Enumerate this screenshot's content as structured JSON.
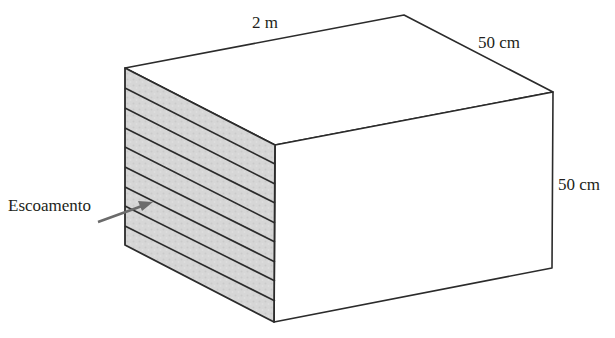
{
  "diagram": {
    "type": "rectangular box (duct section) with layered left face",
    "labels": {
      "length": "2 m",
      "depth": "50 cm",
      "height": "50 cm",
      "flow": "Escoamento"
    },
    "colors": {
      "stroke": "#2b2b2b",
      "face_fill": "#ffffff",
      "layered_face_fill": "#d4d4d4",
      "arrow": "#6b6b6b",
      "text": "#231f20"
    },
    "layered_face_line_count": 8
  }
}
